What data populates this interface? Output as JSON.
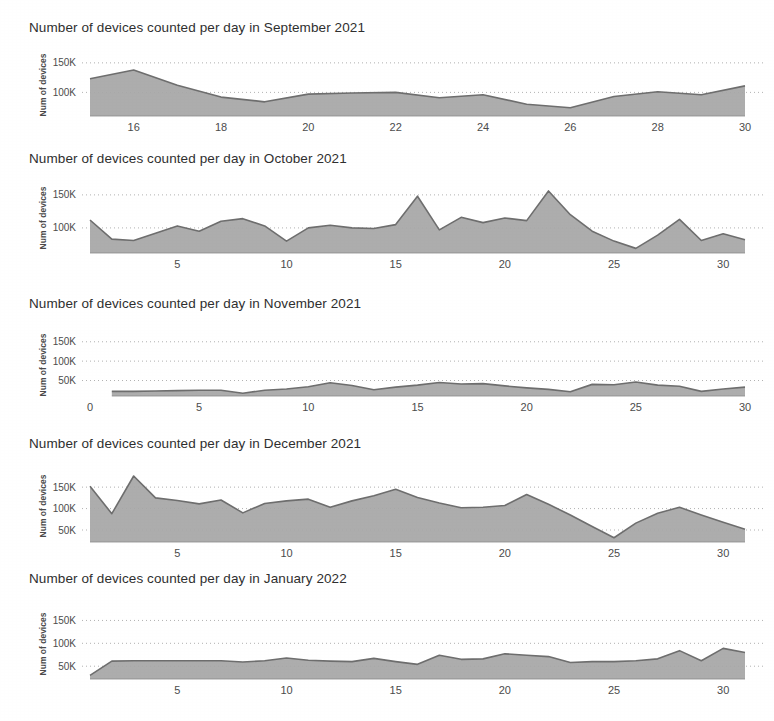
{
  "page": {
    "background_color": "#ffffff",
    "text_color": "#2f2f2f",
    "area_fill_color": "#a6a6a6",
    "area_line_color": "#6e6e6e",
    "gridline_color": "#9a9a9a"
  },
  "charts": [
    {
      "id": "september-2021",
      "title": "Number of devices counted per day in September 2021",
      "chart_data": {
        "type": "area",
        "title": "Number of devices counted per day in September 2021",
        "xlabel": "",
        "ylabel": "Num of devices",
        "ylim": [
          60000,
          165000
        ],
        "yticks": [
          100000,
          150000
        ],
        "yticklabels": [
          "100K",
          "150K"
        ],
        "xlim": [
          15,
          30
        ],
        "xticks": [
          16,
          18,
          20,
          22,
          24,
          26,
          28,
          30
        ],
        "xticklabels": [
          "16",
          "18",
          "20",
          "22",
          "24",
          "26",
          "28",
          "30"
        ],
        "grid": true,
        "legend": "none",
        "x": [
          15,
          16,
          17,
          18,
          19,
          20,
          21,
          22,
          23,
          24,
          25,
          26,
          27,
          28,
          29,
          30
        ],
        "values": [
          123000,
          138000,
          112000,
          92000,
          84000,
          97000,
          99000,
          100000,
          91000,
          96000,
          80000,
          74000,
          93000,
          101000,
          96000,
          111000
        ]
      }
    },
    {
      "id": "october-2021",
      "title": "Number of devices counted per day in October 2021",
      "chart_data": {
        "type": "area",
        "title": "Number of devices counted per day in October 2021",
        "xlabel": "",
        "ylabel": "Num of devices",
        "ylim": [
          62000,
          168000
        ],
        "yticks": [
          100000,
          150000
        ],
        "yticklabels": [
          "100K",
          "150K"
        ],
        "xlim": [
          1,
          31
        ],
        "xticks": [
          5,
          10,
          15,
          20,
          25,
          30
        ],
        "xticklabels": [
          "5",
          "10",
          "15",
          "20",
          "25",
          "30"
        ],
        "grid": true,
        "legend": "none",
        "x": [
          1,
          2,
          3,
          4,
          5,
          6,
          7,
          8,
          9,
          10,
          11,
          12,
          13,
          14,
          15,
          16,
          17,
          18,
          19,
          20,
          21,
          22,
          23,
          24,
          25,
          26,
          27,
          28,
          29,
          30,
          31
        ],
        "values": [
          112000,
          83000,
          81000,
          92000,
          103000,
          95000,
          110000,
          114000,
          103000,
          80000,
          100000,
          104000,
          100000,
          99000,
          105000,
          148000,
          97000,
          116000,
          108000,
          115000,
          111000,
          156000,
          120000,
          95000,
          80000,
          69000,
          89000,
          113000,
          81000,
          91000,
          82000
        ]
      }
    },
    {
      "id": "november-2021",
      "title": "Number of devices counted per day in November 2021",
      "chart_data": {
        "type": "area",
        "title": "Number of devices counted per day in November 2021",
        "xlabel": "",
        "ylabel": "Num of devices",
        "ylim": [
          10000,
          170000
        ],
        "yticks": [
          50000,
          100000,
          150000
        ],
        "yticklabels": [
          "50K",
          "100K",
          "150K"
        ],
        "xlim": [
          0,
          30
        ],
        "xticks": [
          0,
          5,
          10,
          15,
          20,
          25,
          30
        ],
        "xticklabels": [
          "0",
          "5",
          "10",
          "15",
          "20",
          "25",
          "30"
        ],
        "grid": true,
        "legend": "none",
        "x": [
          1,
          2,
          3,
          4,
          5,
          6,
          7,
          8,
          9,
          10,
          11,
          12,
          13,
          14,
          15,
          16,
          17,
          18,
          19,
          20,
          21,
          22,
          23,
          24,
          25,
          26,
          27,
          28,
          29,
          30
        ],
        "values": [
          22000,
          22000,
          23000,
          24000,
          25000,
          25000,
          17000,
          25000,
          28000,
          34000,
          44000,
          37000,
          26000,
          33000,
          38000,
          45000,
          41000,
          42000,
          36000,
          31000,
          27000,
          21000,
          40000,
          39000,
          46000,
          38000,
          35000,
          22000,
          28000,
          33000
        ]
      }
    },
    {
      "id": "december-2021",
      "title": "Number of devices counted per day in December 2021",
      "chart_data": {
        "type": "area",
        "title": "Number of devices counted per day in December 2021",
        "xlabel": "",
        "ylabel": "Num of devices",
        "ylim": [
          22000,
          190000
        ],
        "yticks": [
          50000,
          100000,
          150000
        ],
        "yticklabels": [
          "50K",
          "100K",
          "150K"
        ],
        "xlim": [
          1,
          31
        ],
        "xticks": [
          5,
          10,
          15,
          20,
          25,
          30
        ],
        "xticklabels": [
          "5",
          "10",
          "15",
          "20",
          "25",
          "30"
        ],
        "grid": true,
        "legend": "none",
        "x": [
          1,
          2,
          3,
          4,
          5,
          6,
          7,
          8,
          9,
          10,
          11,
          12,
          13,
          14,
          15,
          16,
          17,
          18,
          19,
          20,
          21,
          22,
          23,
          24,
          25,
          26,
          27,
          28,
          29,
          30,
          31
        ],
        "values": [
          152000,
          88000,
          176000,
          125000,
          119000,
          111000,
          120000,
          90000,
          112000,
          118000,
          122000,
          103000,
          118000,
          130000,
          145000,
          126000,
          113000,
          102000,
          103000,
          107000,
          133000,
          110000,
          85000,
          58000,
          32000,
          66000,
          89000,
          103000,
          85000,
          68000,
          52000
        ]
      }
    },
    {
      "id": "january-2022",
      "title": "Number of devices counted per day in January 2022",
      "chart_data": {
        "type": "area",
        "title": "Number of devices counted per day in January 2022",
        "xlabel": "",
        "ylabel": "Num of devices",
        "ylim": [
          22000,
          175000
        ],
        "yticks": [
          50000,
          100000,
          150000
        ],
        "yticklabels": [
          "50K",
          "100K",
          "150K"
        ],
        "xlim": [
          1,
          31
        ],
        "xticks": [
          5,
          10,
          15,
          20,
          25,
          30
        ],
        "xticklabels": [
          "5",
          "10",
          "15",
          "20",
          "25",
          "30"
        ],
        "grid": true,
        "legend": "none",
        "x": [
          1,
          2,
          3,
          4,
          5,
          6,
          7,
          8,
          9,
          10,
          11,
          12,
          13,
          14,
          15,
          16,
          17,
          18,
          19,
          20,
          21,
          22,
          23,
          24,
          25,
          26,
          27,
          28,
          29,
          30,
          31
        ],
        "values": [
          30000,
          61000,
          62000,
          62000,
          62000,
          62000,
          62000,
          59000,
          62000,
          68000,
          63000,
          61000,
          60000,
          67000,
          60000,
          54000,
          74000,
          65000,
          66000,
          77000,
          74000,
          71000,
          58000,
          60000,
          60000,
          62000,
          66000,
          84000,
          62000,
          89000,
          80000
        ]
      }
    }
  ]
}
